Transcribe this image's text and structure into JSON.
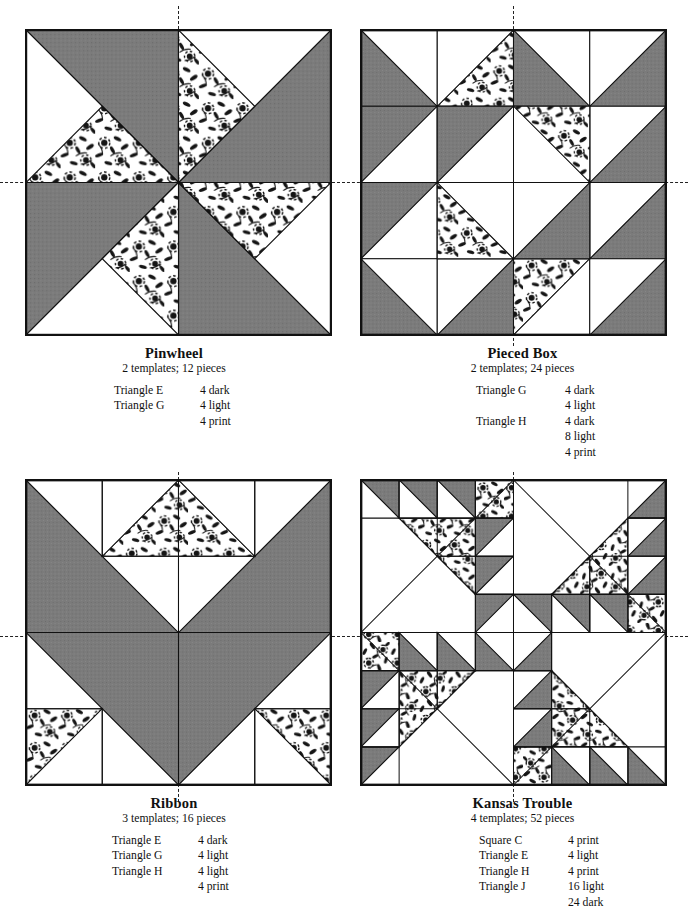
{
  "page": {
    "kind": "quilt-block-pattern-page",
    "colors": {
      "dark": "#7b7b7b",
      "light": "#ffffff",
      "outline": "#111111",
      "print_ink": "#151515",
      "print_ground": "#ffffff",
      "guide": "#222222"
    },
    "legend_terms": [
      "dark",
      "light",
      "print"
    ]
  },
  "blocks": [
    {
      "id": "pinwheel",
      "title": "Pinwheel",
      "subtitle": "2 templates; 12 pieces",
      "templates": 2,
      "pieces": 12,
      "list": [
        {
          "name": "Triangle E",
          "qty": "4 dark"
        },
        {
          "name": "Triangle G",
          "qty": "4 light"
        },
        {
          "name": "",
          "qty": "4 print"
        }
      ]
    },
    {
      "id": "pieced-box",
      "title": "Pieced Box",
      "subtitle": "2 templates; 24 pieces",
      "templates": 2,
      "pieces": 24,
      "list": [
        {
          "name": "Triangle G",
          "qty": "4 dark"
        },
        {
          "name": "",
          "qty": "4 light"
        },
        {
          "name": "Triangle H",
          "qty": "4 dark"
        },
        {
          "name": "",
          "qty": "8 light"
        },
        {
          "name": "",
          "qty": "4 print"
        }
      ]
    },
    {
      "id": "ribbon",
      "title": "Ribbon",
      "subtitle": "3 templates; 16 pieces",
      "templates": 3,
      "pieces": 16,
      "list": [
        {
          "name": "Triangle E",
          "qty": "4 dark"
        },
        {
          "name": "Triangle G",
          "qty": "4 light"
        },
        {
          "name": "Triangle H",
          "qty": "4 light"
        },
        {
          "name": "",
          "qty": "4 print"
        }
      ]
    },
    {
      "id": "kansas-trouble",
      "title": "Kansas Trouble",
      "subtitle": "4 templates; 52 pieces",
      "templates": 4,
      "pieces": 52,
      "list": [
        {
          "name": "Square C",
          "qty": "4 print"
        },
        {
          "name": "Triangle E",
          "qty": "4 light"
        },
        {
          "name": "Triangle H",
          "qty": "4 print"
        },
        {
          "name": "Triangle J",
          "qty": "16 light"
        },
        {
          "name": "",
          "qty": "24 dark"
        }
      ]
    }
  ]
}
